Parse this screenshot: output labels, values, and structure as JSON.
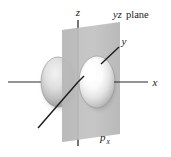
{
  "figure": {
    "background_color": "#ffffff",
    "width": 171,
    "height": 157
  },
  "labels": {
    "axis_z": "z",
    "axis_y": "y",
    "axis_x": "x",
    "plane_italic": "yz",
    "plane_roman": "plane",
    "orbital_symbol": "p",
    "orbital_subscript": "x"
  },
  "colors": {
    "axis_line": "#2b2b2b",
    "plane_fill": "#b9b9b9",
    "plane_fill_light": "#c9c9c9",
    "lobe_bright": "#fdfdfd",
    "lobe_mid": "#d2d2d2",
    "lobe_shadow": "#8d8d8d",
    "lobe_outline": "#9a9a9a",
    "text": "#1a1a1a"
  },
  "geometry": {
    "origin": {
      "x": 78,
      "y": 82
    },
    "z_axis": {
      "x1": 78,
      "y1": 20,
      "x2": 78,
      "y2": 146
    },
    "x_axis": {
      "x1": 8,
      "y1": 82,
      "x2": 148,
      "y2": 82
    },
    "y_axis": {
      "x1": 38,
      "y1": 128,
      "x2": 119,
      "y2": 47
    },
    "plane_points": "62,30 120,22 120,134 62,142",
    "lobe_left": {
      "cx": 58,
      "cy": 82,
      "rx": 17,
      "ry": 25
    },
    "lobe_right": {
      "cx": 97,
      "cy": 82,
      "rx": 18,
      "ry": 26
    }
  },
  "label_positions": {
    "axis_z": {
      "x": 78,
      "y": 16
    },
    "axis_y": {
      "x": 124,
      "y": 45
    },
    "axis_x": {
      "x": 155,
      "y": 86
    },
    "plane": {
      "x": 113,
      "y": 17
    },
    "orbital": {
      "x": 100,
      "y": 140
    }
  }
}
